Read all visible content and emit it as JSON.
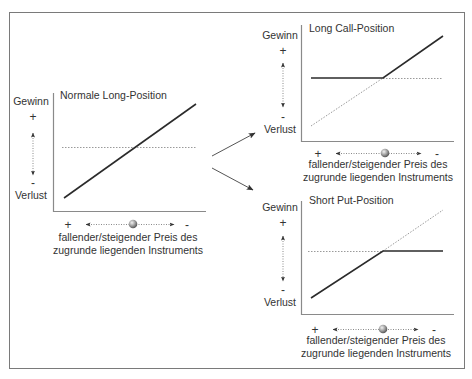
{
  "colors": {
    "frame": "#7a7a7a",
    "axis": "#8a8a8a",
    "line": "#2b2b2b",
    "dotted": "#9a9a9a",
    "text": "#333333"
  },
  "common": {
    "y_top_label": "Gewinn",
    "y_plus": "+",
    "y_minus": "-",
    "y_bottom_label": "Verlust",
    "x_plus": "+",
    "x_minus": "-",
    "x_label_line1": "fallender/steigender Preis des",
    "x_label_line2": "zugrunde liegenden Instruments"
  },
  "panels": [
    {
      "id": "long",
      "title": "Normale Long-Position",
      "y_top_label": "Gewinn",
      "y_bottom_label": "Verlust",
      "x_label_line1": "fallender/steigender Preis des",
      "x_label_line2": "zugrunde liegenden Instruments"
    },
    {
      "id": "long-call",
      "title": "Long Call-Position",
      "y_top_label": "Gewinn",
      "y_bottom_label": "Verlust",
      "x_label_line1": "fallender/steigender Preis des",
      "x_label_line2": "zugrunde liegenden Instruments"
    },
    {
      "id": "short-put",
      "title": "Short Put-Position",
      "y_top_label": "Gewinn",
      "y_bottom_label": "Verlust",
      "x_label_line1": "fallender/steigender Preis des",
      "x_label_line2": "zugrunde liegenden Instruments"
    }
  ],
  "icons": {
    "flow_arrows": "arrow-right-icon",
    "price_marker": "ball-marker-icon"
  }
}
